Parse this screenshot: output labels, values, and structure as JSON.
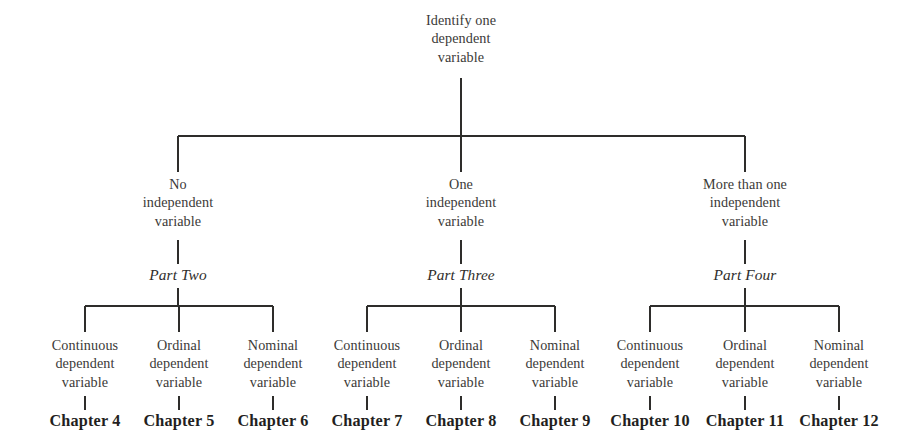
{
  "diagram": {
    "title": "Identify one dependent variable",
    "root": {
      "label": "Identify one\ndependent\nvariable"
    },
    "branches": [
      {
        "id": "no-independent-variable",
        "label": "No\nindependent\nvariable",
        "part_label": "Part Two",
        "leaves": [
          {
            "id": "continuous",
            "label": "Continuous\ndependent\nvariable",
            "chapter": "Chapter 4"
          },
          {
            "id": "ordinal",
            "label": "Ordinal\ndependent\nvariable",
            "chapter": "Chapter 5"
          },
          {
            "id": "nominal",
            "label": "Nominal\ndependent\nvariable",
            "chapter": "Chapter 6"
          }
        ]
      },
      {
        "id": "one-independent-variable",
        "label": "One\nindependent\nvariable",
        "part_label": "Part Three",
        "leaves": [
          {
            "id": "continuous",
            "label": "Continuous\ndependent\nvariable",
            "chapter": "Chapter 7"
          },
          {
            "id": "ordinal",
            "label": "Ordinal\ndependent\nvariable",
            "chapter": "Chapter 8"
          },
          {
            "id": "nominal",
            "label": "Nominal\ndependent\nvariable",
            "chapter": "Chapter 9"
          }
        ]
      },
      {
        "id": "more-than-one-independent-variable",
        "label": "More than one\nindependent\nvariable",
        "part_label": "Part Four",
        "leaves": [
          {
            "id": "continuous",
            "label": "Continuous\ndependent\nvariable",
            "chapter": "Chapter 10"
          },
          {
            "id": "ordinal",
            "label": "Ordinal\ndependent\nvariable",
            "chapter": "Chapter 11"
          },
          {
            "id": "nominal",
            "label": "Nominal\ndependent\nvariable",
            "chapter": "Chapter 12"
          }
        ]
      }
    ],
    "colors": {
      "line": "#2e2d2b",
      "text": "#3b3a38",
      "chapter_text": "#231f1e",
      "background": "#ffffff"
    }
  }
}
